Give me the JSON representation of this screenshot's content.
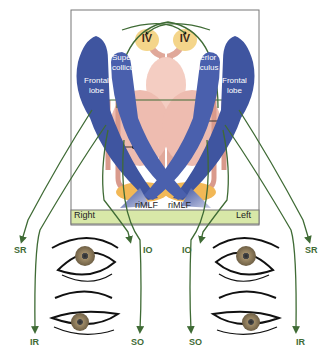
{
  "diagram": {
    "nuclei": {
      "left_iv": "IV",
      "right_iv": "IV"
    },
    "labels": {
      "superior_colliculus_left": [
        "Superior",
        "colliculus"
      ],
      "superior_colliculus_right": [
        "Superior",
        "colliculus"
      ],
      "frontal_lobe_left": [
        "Frontal",
        "lobe"
      ],
      "frontal_lobe_right": [
        "Frontal",
        "lobe"
      ],
      "rimlf_left": "riMLF",
      "rimlf_right": "riMLF"
    },
    "side_bar": {
      "right_label": "Right",
      "left_label": "Left"
    },
    "muscles": {
      "right_eye_top_left": "SR",
      "right_eye_top_right": "IO",
      "right_eye_bottom_left": "IR",
      "right_eye_bottom_right": "SO",
      "left_eye_top_left": "IO",
      "left_eye_top_right": "SR",
      "left_eye_bottom_left": "SO",
      "left_eye_bottom_right": "IR"
    },
    "colors": {
      "pathway": "#3f6b35",
      "frontal": "#3f55a0",
      "brainstem": "#e8b3a6",
      "nucleus": "#f2c66a",
      "sidebar": "#d8e8a8",
      "iris": "#8b7a5a"
    }
  }
}
